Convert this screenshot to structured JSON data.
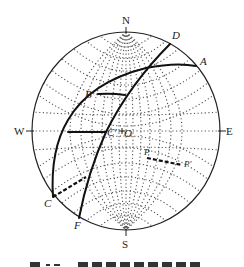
{
  "diagram": {
    "type": "stereographic projection (Wulff net) with great circles",
    "net": {
      "center": [
        126,
        131
      ],
      "rx": 94,
      "ry": 99,
      "grid_style": "dotted",
      "grid_color": "#444444"
    },
    "directions": {
      "north": "N",
      "south": "S",
      "east": "E",
      "west": "W"
    },
    "points": {
      "A": {
        "label": "A",
        "pos": [
          196,
          66
        ]
      },
      "B": {
        "label": "B",
        "pos": [
          98,
          94
        ]
      },
      "C_prime": {
        "label": "C'",
        "pos": [
          106,
          132
        ]
      },
      "O": {
        "label": "O",
        "pos": [
          122,
          132
        ]
      },
      "C": {
        "label": "C",
        "pos": [
          53,
          197
        ]
      },
      "D": {
        "label": "D",
        "pos": [
          170,
          44
        ]
      },
      "F": {
        "label": "F",
        "pos": [
          79,
          218
        ]
      },
      "P": {
        "label": "P",
        "pos": [
          147,
          157
        ]
      },
      "P_prime": {
        "label": "P'",
        "pos": [
          182,
          165
        ]
      }
    },
    "curves": [
      {
        "name": "great-circle-CA",
        "from": "C",
        "to": "A",
        "style": "solid-bold"
      },
      {
        "name": "great-circle-FD",
        "from": "F",
        "to": "D",
        "style": "solid-bold"
      },
      {
        "name": "segment-B-to-FD",
        "style": "solid-bold"
      },
      {
        "name": "segment-through-C-prime",
        "style": "solid-bold"
      },
      {
        "name": "segment-C-to-FD",
        "style": "dashed-bold"
      },
      {
        "name": "segment-P-P-prime",
        "style": "dashed-bold"
      }
    ],
    "line_color": "#111111"
  },
  "caption": {
    "visible": "cropped (text illegible)"
  }
}
